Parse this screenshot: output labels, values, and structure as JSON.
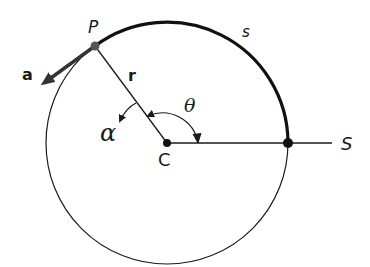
{
  "diagram": {
    "labels": {
      "point_p": "P",
      "arc_s": "s",
      "acceleration": "a",
      "radius": "r",
      "angular_acceleration": "α",
      "angle": "θ",
      "center": "C",
      "reference": "S"
    },
    "colors": {
      "stroke": "#1a1a1a",
      "point_p": "#555555"
    }
  }
}
